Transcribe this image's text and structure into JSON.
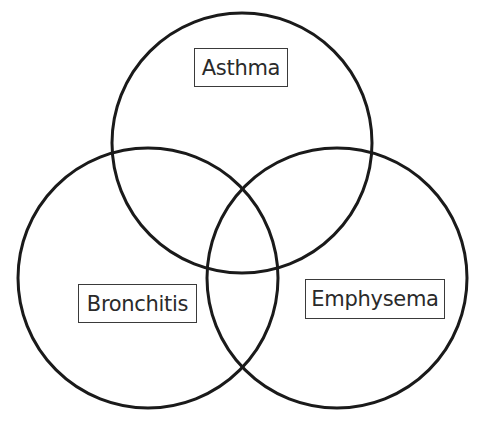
{
  "diagram": {
    "type": "venn",
    "sets": [
      {
        "id": "asthma",
        "label": "Asthma",
        "cx": 242,
        "cy": 143,
        "r": 130
      },
      {
        "id": "bronchitis",
        "label": "Bronchitis",
        "cx": 148,
        "cy": 278,
        "r": 130
      },
      {
        "id": "emphysema",
        "label": "Emphysema",
        "cx": 337,
        "cy": 278,
        "r": 130
      }
    ],
    "colors": {
      "stroke": "#1a1a1a",
      "label_border": "#3a3a3a",
      "background": "#ffffff"
    }
  }
}
